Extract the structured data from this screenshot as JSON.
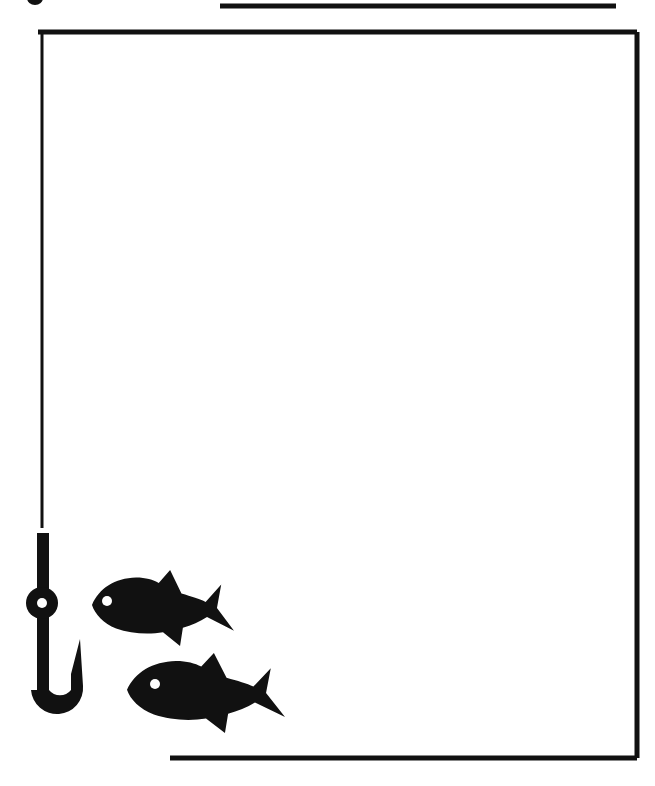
{
  "page": {
    "background_color": "#FFFFFF",
    "ink_color": "#111111",
    "width": 655,
    "height": 786,
    "style": "black-and-white clip-art line drawing",
    "caption": "A fishing hook hanging from a line that forms the left and top border of an open rectangular frame, with two fish silhouettes swimming toward the hook."
  },
  "elements": {
    "top_rule": {
      "name": "top-rule",
      "label": "Horizontal rule above frame",
      "x1": 220,
      "y1": 6,
      "x2": 616,
      "y2": 6,
      "thickness": 5,
      "color": "#111111"
    },
    "corner_dot": {
      "name": "corner-dot",
      "label": "Clipped bullet mark at top-left",
      "cx": 35,
      "cy": -2,
      "rx": 8,
      "ry": 7,
      "color": "#111111"
    },
    "frame": {
      "name": "frame-border",
      "label": "Open rectangular frame",
      "left": 38,
      "top": 32,
      "right": 637,
      "bottom": 758,
      "thickness_top": 5,
      "thickness_right": 5,
      "color": "#111111",
      "open_sides": "left-lower and bottom-left"
    },
    "bottom_rule": {
      "name": "bottom-rule",
      "label": "Lower horizontal rule",
      "x1": 170,
      "y1": 758,
      "x2": 637,
      "y2": 758,
      "thickness": 5,
      "color": "#111111"
    },
    "fishing_line": {
      "name": "fishing-line",
      "label": "Thin vertical fishing line",
      "x": 42,
      "y_top": 34,
      "y_bottom": 528,
      "thickness": 3,
      "color": "#111111"
    },
    "hook": {
      "name": "fishing-hook",
      "label": "Fishing hook with eye, shank, bend and barbed point",
      "color": "#111111",
      "shank": {
        "x": 37,
        "y_top": 533,
        "width": 12,
        "y_bottom": 700
      },
      "eye": {
        "cx": 42,
        "cy": 603,
        "outer_r": 16,
        "hole_r": 5,
        "hole_color": "#FFFFFF"
      },
      "bend_center": {
        "cx": 57,
        "cy": 690,
        "radius": 26
      },
      "point": {
        "x": 80,
        "y": 639
      }
    },
    "fish": [
      {
        "name": "fish-upper",
        "label": "Upper fish silhouette facing left",
        "x": 92,
        "y": 570,
        "width": 142,
        "height": 76,
        "facing": "left",
        "color": "#111111",
        "eye": {
          "cx": 107,
          "cy": 601,
          "r": 5,
          "color": "#FFFFFF"
        }
      },
      {
        "name": "fish-lower",
        "label": "Lower fish silhouette facing left",
        "x": 127,
        "y": 653,
        "width": 158,
        "height": 80,
        "facing": "left",
        "color": "#111111",
        "eye": {
          "cx": 155,
          "cy": 684,
          "r": 5,
          "color": "#FFFFFF"
        }
      }
    ]
  }
}
